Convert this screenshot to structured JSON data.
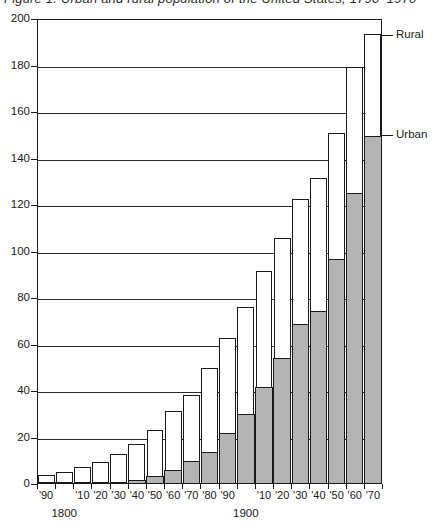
{
  "caption": {
    "text": "Figure 1.  Urban and rural population of the United States, 1790–1970"
  },
  "chart_data": {
    "type": "bar",
    "subtype": "stacked-vertical",
    "title": "",
    "xlabel": "",
    "ylabel": "",
    "ylim": [
      0,
      200
    ],
    "ytick_step": 20,
    "ytick_labels": [
      "0",
      "20",
      "40",
      "60",
      "80",
      "100",
      "120",
      "140",
      "160",
      "180",
      "200"
    ],
    "ytick_values": [
      0,
      20,
      40,
      60,
      80,
      100,
      120,
      140,
      160,
      180,
      200
    ],
    "grid": "horizontal",
    "legend_position": "right-callouts",
    "categories": [
      "'90",
      "1800",
      "'10",
      "'20",
      "'30",
      "'40",
      "'50",
      "'60",
      "'70",
      "'80",
      "'90",
      "1900",
      "'10",
      "'20",
      "'30",
      "'40",
      "'50",
      "'60",
      "'70"
    ],
    "xtick_labels": [
      "'90",
      "",
      "'10",
      "'20",
      "'30",
      "'40",
      "'50",
      "'60",
      "'70",
      "'80",
      "'90",
      "",
      "'10",
      "'20",
      "'30",
      "'40",
      "'50",
      "'60",
      "'70"
    ],
    "century_labels": [
      {
        "label": "1800",
        "category": "1800"
      },
      {
        "label": "1900",
        "category": "1900"
      }
    ],
    "series": [
      {
        "name": "Urban",
        "color": "#b4b4b4",
        "values": [
          0.2,
          0.3,
          0.5,
          0.7,
          1.1,
          1.8,
          3.5,
          6.2,
          9.9,
          14.1,
          22.1,
          30.2,
          42.0,
          54.2,
          69.0,
          74.4,
          96.8,
          125.3,
          149.6
        ]
      },
      {
        "name": "Rural",
        "color": "#ffffff",
        "values": [
          3.7,
          4.9,
          6.7,
          8.9,
          11.7,
          15.2,
          19.6,
          25.2,
          28.6,
          36.0,
          40.8,
          45.8,
          49.8,
          51.4,
          53.8,
          57.2,
          54.2,
          54.1,
          43.8
        ]
      }
    ],
    "totals": [
      3.9,
      5.2,
      7.2,
      9.6,
      12.8,
      17.0,
      23.1,
      31.4,
      38.5,
      50.1,
      62.9,
      76.0,
      91.8,
      105.6,
      122.8,
      131.6,
      151.0,
      179.4,
      193.4
    ],
    "callouts": [
      {
        "label": "Rural",
        "series": "Rural",
        "points_to_category": "'70",
        "value": 193
      },
      {
        "label": "Urban",
        "series": "Urban",
        "points_to_category": "'70",
        "value": 150
      }
    ]
  }
}
